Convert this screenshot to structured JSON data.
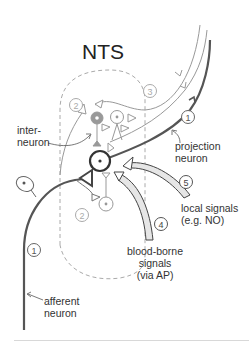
{
  "title": "NTS",
  "labels": {
    "interneuron": "inter-\nneuron",
    "projection_neuron": "projection\nneuron",
    "local_signals": "local signals\n(e.g. NO)",
    "blood_borne_signals": "blood-borne\nsignals\n(via AP)",
    "afferent_neuron": "afferent\nneuron"
  },
  "markers": {
    "m1_projection": "1",
    "m1_afferent": "1",
    "m2_top": "2",
    "m2_bottom": "2",
    "m3": "3",
    "m4": "4",
    "m5": "5"
  },
  "colors": {
    "dark_line": "#555555",
    "mid_line": "#888888",
    "light_line": "#aaaaaa",
    "dashed_region": "#aaaaaa",
    "interneuron_fill": "#999999",
    "signal_fill": "#e6e6e6"
  }
}
